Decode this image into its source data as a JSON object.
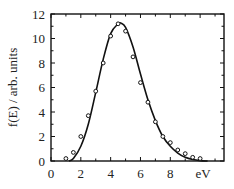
{
  "chart_data": {
    "type": "line",
    "title": "",
    "xlabel": "eV",
    "ylabel": "f(E) / arb. units",
    "xlim": [
      0,
      11.6
    ],
    "ylim": [
      0,
      12
    ],
    "xticks": [
      "0",
      "2",
      "4",
      "6",
      "8"
    ],
    "yticks": [
      "0",
      "2",
      "4",
      "6",
      "8",
      "10",
      "12"
    ],
    "grid": false,
    "legend": null,
    "series": [
      {
        "name": "data points",
        "style": "open circles",
        "x": [
          1.0,
          1.5,
          2.0,
          2.5,
          3.0,
          3.5,
          4.0,
          4.5,
          5.0,
          5.5,
          6.0,
          6.5,
          7.0,
          7.5,
          8.0,
          8.5,
          9.0,
          9.5,
          10.0
        ],
        "y": [
          0.2,
          0.7,
          2.0,
          3.7,
          5.7,
          8.0,
          10.2,
          11.2,
          10.6,
          8.5,
          6.4,
          4.8,
          3.2,
          2.0,
          1.5,
          0.9,
          0.6,
          0.3,
          0.2
        ]
      },
      {
        "name": "fit curve",
        "style": "solid line",
        "x": [
          1.2,
          1.5,
          2.0,
          2.5,
          3.0,
          3.5,
          4.0,
          4.5,
          4.7,
          5.0,
          5.5,
          6.0,
          6.5,
          7.0,
          7.5,
          8.0,
          8.5,
          9.0,
          9.5,
          10.0,
          10.5
        ],
        "y": [
          0.0,
          0.2,
          1.2,
          3.0,
          5.6,
          8.3,
          10.4,
          11.2,
          11.25,
          10.9,
          9.3,
          7.1,
          5.0,
          3.3,
          2.0,
          1.2,
          0.65,
          0.3,
          0.12,
          0.03,
          0.0
        ]
      }
    ]
  }
}
